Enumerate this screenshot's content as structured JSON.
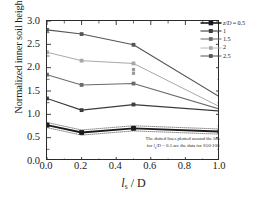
{
  "chart_data": {
    "type": "line",
    "title": "",
    "xlabel": "l_s / D",
    "ylabel": "Normalized inner soil height, h/D",
    "xlim": [
      0.0,
      1.0
    ],
    "ylim": [
      0.0,
      3.0
    ],
    "grid": false,
    "legend_position": "top-right",
    "legend_title": "z/D",
    "x": [
      0.0,
      0.2,
      0.5,
      1.0
    ],
    "series": [
      {
        "name": "z/D = 0.5",
        "values": [
          0.77,
          0.61,
          0.7,
          0.63
        ],
        "marker": "filled-square",
        "color": "#1a1a1a",
        "linewidth": 1.9
      },
      {
        "name": "1",
        "values": [
          1.34,
          1.09,
          1.21,
          1.07
        ],
        "marker": "filled-square",
        "color": "#3c3c3c",
        "linewidth": 1.2
      },
      {
        "name": "1.5",
        "values": [
          1.85,
          1.63,
          1.66,
          1.11
        ],
        "marker": "filled-square",
        "color": "#6a6a6a",
        "linewidth": 1.1
      },
      {
        "name": "2",
        "values": [
          2.33,
          2.15,
          2.09,
          1.16
        ],
        "marker": "filled-square",
        "color": "#a8a8a8",
        "linewidth": 1.0
      },
      {
        "name": "2.5",
        "values": [
          2.81,
          2.72,
          2.49,
          1.37
        ],
        "marker": "filled-square",
        "color": "#555555",
        "linewidth": 1.1
      }
    ],
    "extra_points": [
      {
        "x": 0.5,
        "y": 1.96,
        "note": "S50-100 scatter near z/D=2"
      },
      {
        "x": 0.5,
        "y": 1.88,
        "note": "S50-100 scatter near z/D=2"
      }
    ],
    "annotation": "The dotted lines plotted around the line for lₛ/D = 0.5 are the data for S50-100",
    "xticks": [
      "0.0",
      "0.2",
      "0.4",
      "0.6",
      "0.8",
      "1.0"
    ],
    "xtick_values": [
      0.0,
      0.2,
      0.4,
      0.6,
      0.8,
      1.0
    ],
    "yticks": [
      "0.0",
      "0.5",
      "1.0",
      "1.5",
      "2.0",
      "2.5",
      "3.0"
    ],
    "ytick_values": [
      0.0,
      0.5,
      1.0,
      1.5,
      2.0,
      2.5,
      3.0
    ]
  },
  "axes": {
    "ylabel_prefix": "Normalized inner soil height, ",
    "ylabel_symbol": "h/D",
    "xlabel_symbol": "l",
    "xlabel_sub": "s",
    "xlabel_suffix": " / D"
  },
  "legend": {
    "entries": [
      {
        "label_italic": "z/D",
        "label_rest": " = 0.5"
      },
      {
        "label_italic": "",
        "label_rest": "1"
      },
      {
        "label_italic": "",
        "label_rest": "1.5"
      },
      {
        "label_italic": "",
        "label_rest": "2"
      },
      {
        "label_italic": "",
        "label_rest": "2.5"
      }
    ]
  },
  "note": {
    "line1_a": "The dotted lines plotted around the line",
    "line2_a": "for ",
    "line2_ital": "l",
    "line2_sub": "s",
    "line2_b": "/D = 0.5 are the data for S50-100"
  }
}
